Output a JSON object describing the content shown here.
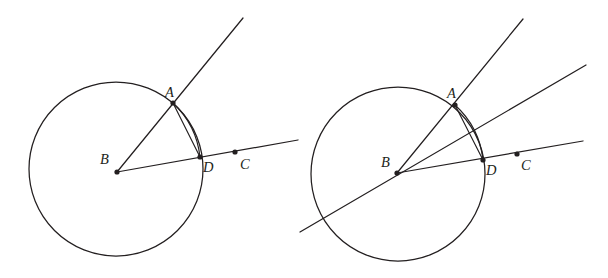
{
  "figure": {
    "background_color": "#ffffff",
    "stroke_color": "#231f20",
    "width": 608,
    "height": 278,
    "panels": [
      {
        "id": "left-panel",
        "name": "left-diagram",
        "circle": {
          "cx": 116,
          "cy": 169,
          "r": 87
        },
        "points": [
          {
            "label": "A",
            "name": "point-a",
            "x": 173,
            "y": 103,
            "label_x": 165,
            "label_y": 97,
            "dot": true
          },
          {
            "label": "B",
            "name": "point-b",
            "x": 117,
            "y": 172,
            "label_x": 100,
            "label_y": 164,
            "dot": true
          },
          {
            "label": "C",
            "name": "point-c",
            "x": 235,
            "y": 152,
            "label_x": 240,
            "label_y": 169,
            "dot": true
          },
          {
            "label": "D",
            "name": "point-d",
            "x": 200,
            "y": 157,
            "label_x": 203,
            "label_y": 172,
            "dot": true
          }
        ],
        "rays": [
          {
            "name": "ray-b-through-a",
            "x1": 117,
            "y1": 172,
            "x2": 243,
            "y2": 18
          },
          {
            "name": "ray-b-through-d-c",
            "x1": 117,
            "y1": 172,
            "x2": 298,
            "y2": 140
          }
        ],
        "chord": {
          "name": "chord-a-d",
          "x1": 173,
          "y1": 103,
          "x2": 200,
          "y2": 157
        },
        "arc": {
          "name": "arc-a-d",
          "x1": 173,
          "y1": 103,
          "x2": 200,
          "y2": 157,
          "r": 87
        }
      },
      {
        "id": "right-panel",
        "name": "right-diagram",
        "circle": {
          "cx": 398,
          "cy": 174,
          "r": 87
        },
        "points": [
          {
            "label": "A",
            "name": "point-a",
            "x": 455,
            "y": 105,
            "label_x": 447,
            "label_y": 98,
            "dot": true
          },
          {
            "label": "B",
            "name": "point-b",
            "x": 397,
            "y": 173,
            "label_x": 381,
            "label_y": 167,
            "dot": true
          },
          {
            "label": "C",
            "name": "point-c",
            "x": 517,
            "y": 154,
            "label_x": 521,
            "label_y": 170,
            "dot": true
          },
          {
            "label": "D",
            "name": "point-d",
            "x": 483,
            "y": 160,
            "label_x": 486,
            "label_y": 175,
            "dot": true
          }
        ],
        "rays": [
          {
            "name": "ray-b-through-a",
            "x1": 397,
            "y1": 173,
            "x2": 523,
            "y2": 19
          },
          {
            "name": "ray-b-through-d-c",
            "x1": 397,
            "y1": 173,
            "x2": 583,
            "y2": 141
          },
          {
            "name": "line-through-b-angle-bisector",
            "x1": 300,
            "y1": 232,
            "x2": 586,
            "y2": 65
          }
        ],
        "chord": {
          "name": "chord-a-d",
          "x1": 455,
          "y1": 105,
          "x2": 483,
          "y2": 160
        },
        "arc": {
          "name": "arc-a-d",
          "x1": 455,
          "y1": 105,
          "x2": 483,
          "y2": 160,
          "r": 87
        }
      }
    ],
    "labels": {
      "a": "A",
      "b": "B",
      "c": "C",
      "d": "D"
    }
  }
}
